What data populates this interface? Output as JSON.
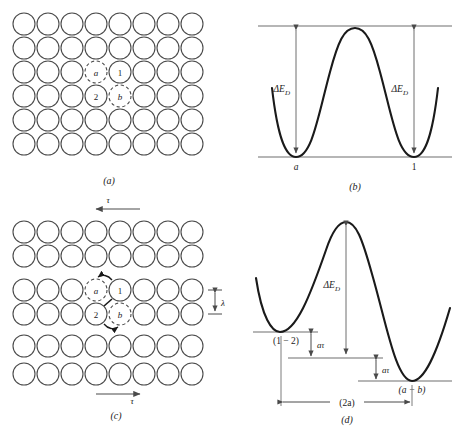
{
  "figure": {
    "panels": [
      {
        "id": "a",
        "caption": "(a)",
        "type": "atom-lattice",
        "description": "Unstressed lattice of atoms with two dislocation core positions",
        "grid": {
          "columns": 8,
          "rows": 6
        },
        "labeled_atoms": [
          {
            "label": "a",
            "style": "dashed",
            "col": 4,
            "row": 3
          },
          {
            "label": "1",
            "style": "solid",
            "col": 5,
            "row": 3
          },
          {
            "label": "2",
            "style": "solid",
            "col": 4,
            "row": 4
          },
          {
            "label": "b",
            "style": "dashed",
            "col": 5,
            "row": 4
          }
        ]
      },
      {
        "id": "b",
        "caption": "(b)",
        "type": "energy-profile",
        "description": "Symmetric double-well Peierls energy profile with no applied stress",
        "well_labels": [
          "a",
          "1"
        ],
        "barrier_label": "ΔE",
        "barrier_sub": "D",
        "arrows": 2,
        "symmetric": true
      },
      {
        "id": "c",
        "caption": "(c)",
        "type": "atom-lattice",
        "description": "Lattice under applied shear stress tau; atoms 1 and 2 move to sites a and b",
        "grid": {
          "columns": 8,
          "rows": 6
        },
        "labeled_atoms": [
          {
            "label": "a",
            "style": "dashed",
            "col": 4,
            "row": 3
          },
          {
            "label": "1",
            "style": "solid",
            "col": 5,
            "row": 3
          },
          {
            "label": "2",
            "style": "solid",
            "col": 4,
            "row": 4
          },
          {
            "label": "b",
            "style": "dashed",
            "col": 5,
            "row": 4
          }
        ],
        "stress_label_top": "τ",
        "stress_label_bottom": "τ",
        "spacing_label": "λ",
        "motion_arrows": [
          "1 → a",
          "2 → b"
        ]
      },
      {
        "id": "d",
        "caption": "(d)",
        "type": "energy-profile",
        "description": "Tilted energy profile under stress; wells shifted by a-tau steps",
        "well_labels": [
          "(1 − 2)",
          "(a − b)"
        ],
        "barrier_label": "ΔE",
        "barrier_sub": "D",
        "step_label_1": "aτ",
        "step_label_2": "aτ",
        "width_label": "(2a)",
        "symmetric": false
      }
    ]
  },
  "style": {
    "line_color": "#1a1a1a",
    "circle_color": "#4a4a4a",
    "axis_color": "#6e6e6e",
    "arrow_color": "#4a4a4a",
    "background": "#ffffff"
  }
}
